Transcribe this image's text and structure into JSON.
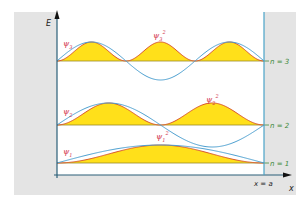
{
  "diagram": {
    "axes": {
      "y_label": "E",
      "x_label": "x",
      "wall_label": "x = a"
    },
    "levels": [
      {
        "n": 3,
        "label": "n = 3",
        "psi_label": "ψ",
        "psi_sub": "3",
        "psi2_label": "ψ",
        "psi2_sub": "3",
        "psi2_sup": "2"
      },
      {
        "n": 2,
        "label": "n = 2",
        "psi_label": "ψ",
        "psi_sub": "2",
        "psi2_label": "ψ",
        "psi2_sub": "2",
        "psi2_sup": "2"
      },
      {
        "n": 1,
        "label": "n = 1",
        "psi_label": "ψ",
        "psi_sub": "1",
        "psi2_label": "ψ",
        "psi2_sub": "1",
        "psi2_sup": "2"
      }
    ],
    "colors": {
      "wall_fill": "#e4e4e4",
      "axis": "#2a5f78",
      "wall_line": "#4aa3c8",
      "psi_curve": "#4b9fd0",
      "psi2_curve": "#d8552c",
      "psi2_fill": "#ffe01a",
      "baseline": "#9a8a2a",
      "psi_label": "#d2344a",
      "level_label": "#3d8a3a"
    }
  }
}
